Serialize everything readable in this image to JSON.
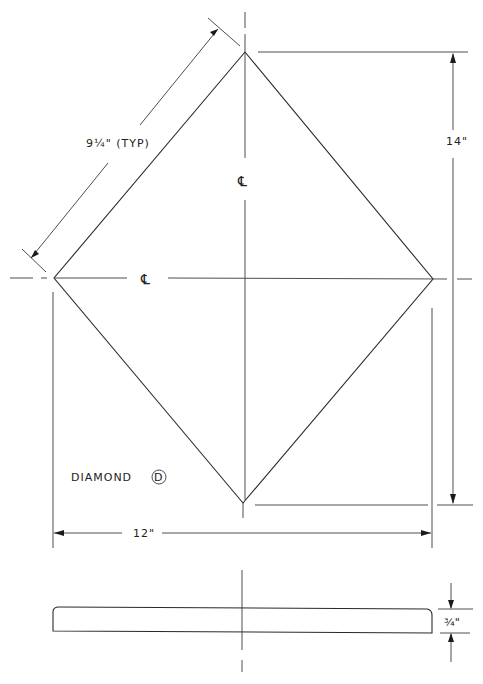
{
  "drawing": {
    "title": "DIAMOND",
    "title_badge": "D",
    "centerline_symbol": "℄",
    "dimensions": {
      "edge_length": "9¼\" (TYP)",
      "height": "14\"",
      "width": "12\"",
      "thickness": "¾\""
    },
    "views": [
      "top-view",
      "side-view"
    ],
    "colors": {
      "line": "#2a2a2a",
      "background": "#ffffff"
    }
  }
}
